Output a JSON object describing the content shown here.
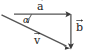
{
  "diagram": {
    "type": "vector-triangle",
    "canvas": {
      "width": 89,
      "height": 56,
      "background": "#ffffff"
    },
    "stroke_color": "#555555",
    "label_color": "#1a1a1a",
    "labels": {
      "a": "a",
      "b": "b",
      "v": "v",
      "alpha": "α"
    },
    "vectors": [
      {
        "name": "a",
        "label": "a",
        "direction": "right",
        "start": {
          "x": 14,
          "y": 14
        },
        "end": {
          "x": 71,
          "y": 14
        }
      },
      {
        "name": "b",
        "label": "b",
        "direction": "down",
        "start": {
          "x": 71,
          "y": 14
        },
        "end": {
          "x": 71,
          "y": 49
        }
      },
      {
        "name": "v",
        "label": "v",
        "direction": "down-right",
        "start": {
          "x": 2,
          "y": 15
        },
        "end": {
          "x": 70,
          "y": 48
        }
      }
    ],
    "angle": {
      "name": "alpha",
      "symbol": "α",
      "vertex": {
        "x": 14,
        "y": 14
      },
      "between": [
        "v",
        "a"
      ]
    }
  }
}
